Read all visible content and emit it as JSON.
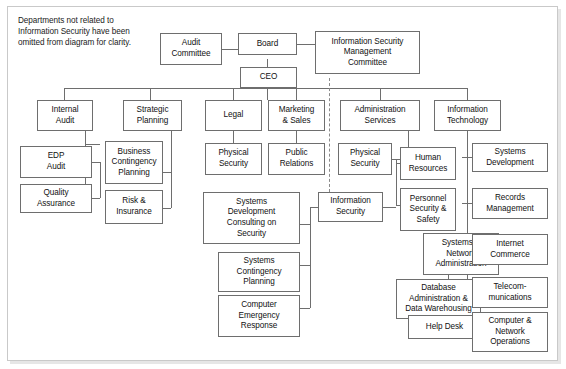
{
  "diagram": {
    "note": "Departments not related to\nInformation Security have been\nomitted from diagram for clarity.",
    "colors": {
      "box_border": "#6e6e6e",
      "frame_border": "#c9c9c9",
      "text": "#111111",
      "line": "#6e6e6e",
      "dashed_line": "#8a8a8a"
    },
    "nodes": {
      "audit_committee": "Audit\nCommittee",
      "board": "Board",
      "ceo": "CEO",
      "ism_committee": "Information Security\nManagement\nCommittee",
      "internal_audit": "Internal\nAudit",
      "strategic_planning": "Strategic\nPlanning",
      "legal": "Legal",
      "marketing_sales": "Marketing\n& Sales",
      "administration_services": "Administration\nServices",
      "information_technology": "Information\nTechnology",
      "edp_audit": "EDP\nAudit",
      "quality_assurance": "Quality\nAssurance",
      "business_contingency_planning": "Business\nContingency\nPlanning",
      "risk_insurance": "Risk &\nInsurance",
      "physical_security_legal": "Physical\nSecurity",
      "public_relations": "Public\nRelations",
      "physical_security_admin": "Physical\nSecurity",
      "human_resources": "Human\nResources",
      "systems_development": "Systems\nDevelopment",
      "information_security": "Information\nSecurity",
      "personnel_security_safety": "Personnel\nSecurity &\nSafety",
      "records_management": "Records\nManagement",
      "systems_development_consulting": "Systems\nDevelopment\nConsulting on\nSecurity",
      "systems_network_administration": "Systems &\nNetwork\nAdministration",
      "internet_commerce": "Internet\nCommerce",
      "systems_contingency_planning": "Systems\nContingency\nPlanning",
      "database_administration": "Database\nAdministration &\nData Warehousing",
      "telecommunications": "Telecom-\nmunications",
      "computer_emergency_response": "Computer\nEmergency\nResponse",
      "help_desk": "Help Desk",
      "computer_network_operations": "Computer &\nNetwork\nOperations"
    }
  }
}
